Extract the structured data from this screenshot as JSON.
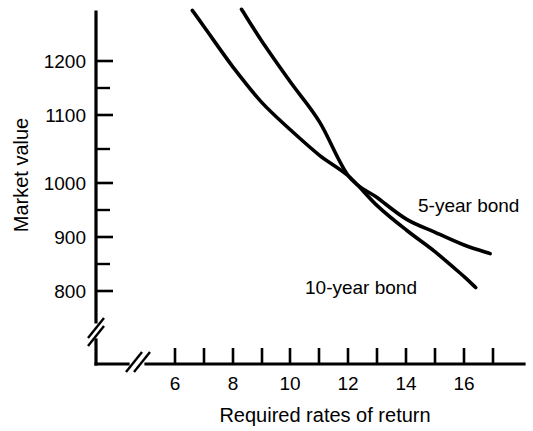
{
  "chart_data": {
    "type": "line",
    "title": "",
    "subtitle": "",
    "xlabel": "Required rates of return",
    "ylabel": "Market value",
    "xlim": [
      5.0,
      17.6
    ],
    "ylim": [
      780,
      1300
    ],
    "grid": false,
    "legend_position": "inline-annotations",
    "axis_breaks": {
      "x_axis_break": true,
      "y_axis_break": true,
      "note": "both axes show a double-slash break between the origin corner and the first plotted value"
    },
    "x_ticks": [
      6,
      7,
      8,
      9,
      10,
      11,
      12,
      13,
      14,
      15,
      16,
      17
    ],
    "x_tick_labels": [
      "6",
      "",
      "8",
      "",
      "10",
      "",
      "12",
      "",
      "14",
      "",
      "16",
      ""
    ],
    "x_labeled_ticks": [
      "6",
      "8",
      "10",
      "12",
      "14",
      "16"
    ],
    "y_ticks": [
      800,
      850,
      900,
      950,
      1000,
      1050,
      1100,
      1150,
      1200
    ],
    "y_tick_labels": [
      "800",
      "",
      "900",
      "",
      "1000",
      "",
      "1100",
      "",
      "1200"
    ],
    "y_labeled_ticks": [
      "800",
      "900",
      "1000",
      "1100",
      "1200"
    ],
    "crossing_point": {
      "x": 12,
      "y": 1000
    },
    "series": [
      {
        "name": "5-year bond",
        "label": "5-year bond",
        "color": "#000000",
        "x": [
          8.3,
          9.0,
          10.0,
          11.0,
          12.0,
          13.0,
          14.0,
          15.0,
          16.0,
          16.9
        ],
        "values": [
          1290,
          1235,
          1163,
          1094,
          1000,
          962,
          925,
          902,
          880,
          865
        ]
      },
      {
        "name": "10-year bond",
        "label": "10-year bond",
        "color": "#000000",
        "x": [
          6.6,
          7.0,
          8.0,
          9.0,
          10.0,
          11.0,
          12.0,
          13.0,
          14.0,
          15.0,
          16.0,
          16.4
        ],
        "values": [
          1288,
          1260,
          1190,
          1128,
          1080,
          1036,
          1000,
          948,
          906,
          868,
          825,
          806
        ]
      }
    ]
  },
  "axis": {
    "x_title": "Required rates of return",
    "y_title": "Market value"
  },
  "annotations": {
    "five_year": "5-year bond",
    "ten_year": "10-year bond"
  },
  "colors": {
    "background": "#ffffff",
    "ink": "#000000",
    "curve": "#000000"
  }
}
